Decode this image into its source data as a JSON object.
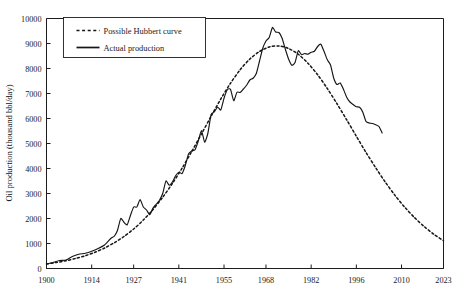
{
  "chart_data": {
    "type": "line",
    "title": "",
    "xlabel": "",
    "ylabel": "Oil production (thousand bbl/day)",
    "xlim": [
      1900,
      2023
    ],
    "ylim": [
      0,
      10000
    ],
    "grid": false,
    "legend_position": "top-left",
    "x_ticks": [
      "1900",
      "1914",
      "1927",
      "1941",
      "1955",
      "1968",
      "1982",
      "1996",
      "2010",
      "2023"
    ],
    "x_tick_values": [
      1900,
      1914,
      1927,
      1941,
      1955,
      1968,
      1982,
      1996,
      2010,
      2023
    ],
    "y_ticks": [
      "0",
      "1000",
      "2000",
      "3000",
      "4000",
      "5000",
      "6000",
      "7000",
      "8000",
      "9000",
      "10000"
    ],
    "y_tick_values": [
      0,
      1000,
      2000,
      3000,
      4000,
      5000,
      6000,
      7000,
      8000,
      9000,
      10000
    ],
    "series": [
      {
        "name": "Possible Hubbert curve",
        "style": "dashed",
        "color": "#151515",
        "x": [
          1900,
          1903,
          1906,
          1909,
          1912,
          1915,
          1918,
          1921,
          1924,
          1927,
          1930,
          1933,
          1936,
          1939,
          1942,
          1945,
          1948,
          1951,
          1954,
          1957,
          1960,
          1963,
          1966,
          1969,
          1972,
          1975,
          1978,
          1981,
          1984,
          1987,
          1990,
          1993,
          1996,
          1999,
          2002,
          2005,
          2008,
          2011,
          2014,
          2017,
          2020,
          2023
        ],
        "values": [
          180,
          240,
          310,
          400,
          510,
          650,
          820,
          1030,
          1280,
          1580,
          1940,
          2360,
          2850,
          3400,
          4010,
          4680,
          5380,
          6090,
          6780,
          7410,
          7950,
          8380,
          8680,
          8860,
          8900,
          8800,
          8570,
          8210,
          7750,
          7200,
          6590,
          5950,
          5290,
          4640,
          4030,
          3450,
          2920,
          2450,
          2040,
          1680,
          1370,
          1110
        ]
      },
      {
        "name": "Actual production",
        "style": "solid",
        "color": "#151515",
        "x": [
          1900,
          1902,
          1904,
          1906,
          1908,
          1910,
          1912,
          1914,
          1916,
          1918,
          1920,
          1921,
          1922,
          1923,
          1924,
          1925,
          1926,
          1927,
          1928,
          1929,
          1930,
          1931,
          1932,
          1933,
          1934,
          1935,
          1936,
          1937,
          1938,
          1939,
          1940,
          1941,
          1942,
          1943,
          1944,
          1945,
          1946,
          1947,
          1948,
          1949,
          1950,
          1951,
          1952,
          1953,
          1954,
          1955,
          1956,
          1957,
          1958,
          1959,
          1960,
          1961,
          1962,
          1963,
          1964,
          1965,
          1966,
          1967,
          1968,
          1969,
          1970,
          1971,
          1972,
          1973,
          1974,
          1975,
          1976,
          1977,
          1978,
          1979,
          1980,
          1981,
          1982,
          1983,
          1984,
          1985,
          1986,
          1987,
          1988,
          1989,
          1990,
          1991,
          1992,
          1993,
          1994,
          1995,
          1996,
          1997,
          1998,
          1999,
          2000,
          2001,
          2002,
          2003,
          2004
        ],
        "values": [
          180,
          240,
          320,
          340,
          480,
          570,
          610,
          690,
          800,
          940,
          1210,
          1290,
          1530,
          2000,
          1850,
          1750,
          2120,
          2460,
          2460,
          2760,
          2460,
          2340,
          2150,
          2420,
          2570,
          2730,
          3000,
          3500,
          3330,
          3460,
          3710,
          3850,
          3800,
          4120,
          4580,
          4700,
          4750,
          5090,
          5520,
          5050,
          5410,
          6160,
          6260,
          6460,
          6340,
          6810,
          7150,
          7170,
          6710,
          7050,
          7040,
          7180,
          7330,
          7540,
          7610,
          7800,
          8300,
          8810,
          9100,
          9240,
          9640,
          9460,
          9440,
          9210,
          8770,
          8380,
          8130,
          8240,
          8710,
          8550,
          8600,
          8570,
          8650,
          8690,
          8880,
          8970,
          8680,
          8350,
          8140,
          7610,
          7360,
          7420,
          7170,
          6850,
          6660,
          6560,
          6470,
          6450,
          6250,
          5880,
          5820,
          5800,
          5750,
          5680,
          5420
        ]
      }
    ]
  },
  "legend": {
    "items": [
      {
        "label": "Possible Hubbert curve",
        "style": "dashed"
      },
      {
        "label": "Actual production",
        "style": "solid"
      }
    ]
  }
}
